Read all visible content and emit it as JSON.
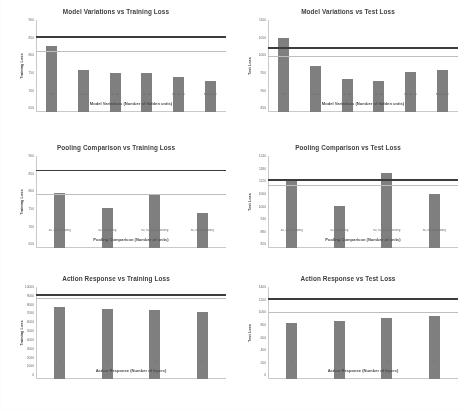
{
  "figure": {
    "background": "#ffffff",
    "bar_color": "#7f7f7f",
    "dark_line_color": "#3c3c3c",
    "light_line_color": "#bdbdbd"
  },
  "chart_data": [
    {
      "type": "bar",
      "title": "Model Variations vs Training Loss",
      "xlabel": "Model Variations (Number of hidden units)",
      "ylabel": "Training Loss",
      "categories": [
        "40",
        "20, 20",
        "40, 40",
        "80, 80",
        "40, 40, 40",
        "80, 80, 80"
      ],
      "values": [
        830,
        765,
        755,
        755,
        745,
        735
      ],
      "ylim": [
        650,
        900
      ],
      "yticks": [
        "900",
        "850",
        "800",
        "750",
        "700",
        "650"
      ],
      "reference_lines": [
        {
          "name": "baseline-dark",
          "value": 852,
          "color": "#3c3c3c"
        },
        {
          "name": "baseline-light",
          "value": 812,
          "color": "#bdbdbd"
        }
      ],
      "grid": false,
      "legend": "none"
    },
    {
      "type": "bar",
      "title": "Model Variations vs Test Loss",
      "xlabel": "Model Variations (Number of hidden units)",
      "ylabel": "Test Loss",
      "categories": [
        "40",
        "20, 20",
        "40, 40",
        "80, 80",
        "40, 40, 40",
        "80, 80, 80"
      ],
      "values": [
        1050,
        975,
        940,
        935,
        960,
        965
      ],
      "ylim": [
        850,
        1100
      ],
      "yticks": [
        "1100",
        "1050",
        "1000",
        "950",
        "900",
        "850"
      ],
      "reference_lines": [
        {
          "name": "baseline-dark",
          "value": 1022,
          "color": "#3c3c3c"
        },
        {
          "name": "baseline-light",
          "value": 1000,
          "color": "#bdbdbd"
        }
      ],
      "grid": false,
      "legend": "none"
    },
    {
      "type": "bar",
      "title": "Pooling Comparison vs Training Loss",
      "xlabel": "Pooling Comparison (Number of units)",
      "ylabel": "Training Loss",
      "categories": [
        "40, 40 no pooling",
        "40, 40 pooling",
        "80, 80, 80 no pooling",
        "80, 80, 80 pooling"
      ],
      "values": [
        800,
        760,
        798,
        745
      ],
      "ylim": [
        650,
        900
      ],
      "yticks": [
        "900",
        "850",
        "800",
        "750",
        "700",
        "650"
      ],
      "reference_lines": [
        {
          "name": "baseline-dark",
          "value": 858,
          "color": "#3c3c3c"
        },
        {
          "name": "baseline-light",
          "value": 795,
          "color": "#bdbdbd"
        }
      ],
      "grid": false,
      "legend": "none"
    },
    {
      "type": "bar",
      "title": "Pooling Comparison vs Test Loss",
      "xlabel": "Pooling Comparison (Number of units)",
      "ylabel": "Test Loss",
      "categories": [
        "40, 40 no pooling",
        "40, 40 pooling",
        "80, 80, 80 no pooling",
        "80, 80, 80 pooling"
      ],
      "values": [
        1120,
        1000,
        1160,
        1060
      ],
      "ylim": [
        800,
        1240
      ],
      "yticks": [
        "1240",
        "1180",
        "1120",
        "1060",
        "1000",
        "940",
        "880",
        "820"
      ],
      "reference_lines": [
        {
          "name": "baseline-dark",
          "value": 1122,
          "color": "#3c3c3c"
        },
        {
          "name": "baseline-light",
          "value": 1098,
          "color": "#bdbdbd"
        }
      ],
      "grid": false,
      "legend": "none"
    },
    {
      "type": "bar",
      "title": "Action Response vs Training Loss",
      "xlabel": "Action Response (Number of layers)",
      "ylabel": "Training Loss",
      "categories": [
        "1",
        "2",
        "3",
        "4"
      ],
      "values": [
        7800,
        7600,
        7450,
        7300
      ],
      "ylim": [
        0,
        10000
      ],
      "yticks": [
        "10000",
        "9000",
        "8000",
        "7000",
        "6000",
        "5000",
        "4000",
        "3000",
        "2000",
        "1000",
        "0"
      ],
      "reference_lines": [
        {
          "name": "baseline-dark",
          "value": 9050,
          "color": "#3c3c3c"
        },
        {
          "name": "baseline-light",
          "value": 8750,
          "color": "#bdbdbd"
        }
      ],
      "grid": false,
      "legend": "none"
    },
    {
      "type": "bar",
      "title": "Action Response vs Test Loss",
      "xlabel": "Action Response (Number of layers)",
      "ylabel": "Test Loss",
      "categories": [
        "1",
        "2",
        "3",
        "4"
      ],
      "values": [
        860,
        890,
        930,
        960
      ],
      "ylim": [
        0,
        1400
      ],
      "yticks": [
        "1400",
        "1200",
        "1000",
        "800",
        "600",
        "400",
        "200",
        "0"
      ],
      "reference_lines": [
        {
          "name": "baseline-dark",
          "value": 1210,
          "color": "#3c3c3c"
        },
        {
          "name": "baseline-light",
          "value": 1000,
          "color": "#bdbdbd"
        }
      ],
      "grid": false,
      "legend": "none"
    }
  ]
}
